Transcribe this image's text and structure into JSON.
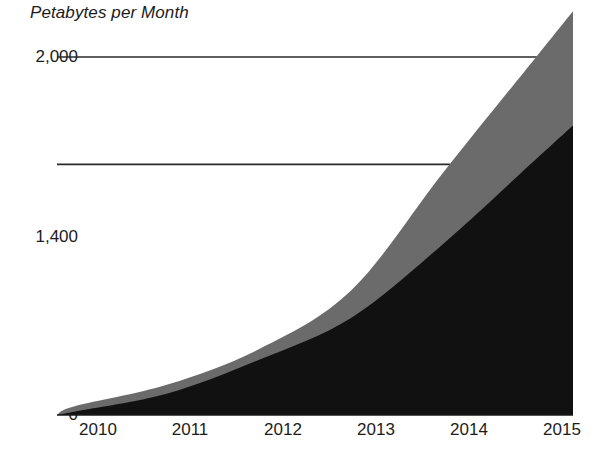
{
  "chart_data": {
    "type": "area",
    "title": "Petabytes per Month",
    "subtitle": "",
    "xlabel": "",
    "ylabel": "Petabytes per Month",
    "stacked": true,
    "grid": true,
    "legend": "none",
    "categories": [
      "2010",
      "2011",
      "2012",
      "2013",
      "2014",
      "2015"
    ],
    "x": [
      2010,
      2011,
      2012,
      2013,
      2014,
      2015
    ],
    "xlim": [
      2009.8,
      2015.4
    ],
    "ylim": [
      0,
      2000
    ],
    "yticks": [
      0,
      1400,
      2000
    ],
    "ytick_labels": [
      "0",
      "1,400",
      "2,000"
    ],
    "xtick_labels": [
      "2010",
      "2011",
      "2012",
      "2013",
      "2014",
      "2015"
    ],
    "series": [
      {
        "name": "lower-band",
        "color": "#111111",
        "values": [
          20,
          120,
          310,
          545,
          960,
          1430
        ]
      },
      {
        "name": "upper-band",
        "color": "#6b6b6b",
        "values": [
          30,
          50,
          60,
          155,
          400,
          570
        ]
      }
    ],
    "cumulative_totals": [
      50,
      170,
      370,
      700,
      1360,
      2000
    ],
    "units": "Petabytes per Month"
  },
  "axis": {
    "y_ticks": [
      {
        "label": "2,000",
        "value": 2000
      },
      {
        "label": "1,400",
        "value": 1400
      },
      {
        "label": "0",
        "value": 0
      }
    ],
    "x_ticks": [
      {
        "label": "2010",
        "value": 2010
      },
      {
        "label": "2011",
        "value": 2011
      },
      {
        "label": "2012",
        "value": 2012
      },
      {
        "label": "2013",
        "value": 2013
      },
      {
        "label": "2014",
        "value": 2014
      },
      {
        "label": "2015",
        "value": 2015
      }
    ]
  },
  "colors": {
    "background": "#ffffff",
    "text": "#1c1c1c",
    "axis_line": "#1a1a1a",
    "grid_line": "#2a2a2a",
    "series_lower": "#111111",
    "series_upper": "#6b6b6b"
  }
}
